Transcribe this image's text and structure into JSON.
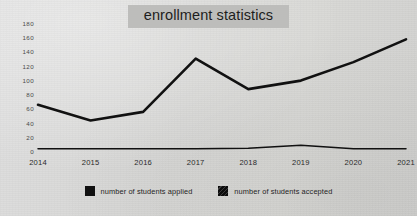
{
  "chart_data": {
    "type": "line",
    "title": "enrollment statistics",
    "xlabel": "",
    "ylabel": "",
    "categories": [
      "2014",
      "2015",
      "2016",
      "2017",
      "2018",
      "2019",
      "2020",
      "2021"
    ],
    "ylim": [
      0,
      180
    ],
    "yticks": [
      0,
      20,
      40,
      60,
      80,
      100,
      120,
      140,
      160,
      180
    ],
    "ytick_labels": [
      "0",
      "20",
      "40",
      "60",
      "80",
      "100",
      "120",
      "140",
      "160",
      "180"
    ],
    "grid": false,
    "legend_position": "bottom",
    "series": [
      {
        "name": "number of students applied",
        "swatch": "solid-dark-square",
        "color": "#111111",
        "values": [
          65,
          43,
          55,
          130,
          87,
          99,
          125,
          157
        ]
      },
      {
        "name": "number of students accepted",
        "swatch": "textured-dark-square",
        "color": "#111111",
        "values": [
          3,
          3,
          3,
          3,
          4,
          8,
          3,
          3
        ]
      }
    ]
  },
  "legend": {
    "items": [
      {
        "label": "number of students applied"
      },
      {
        "label": "number of students accepted"
      }
    ]
  }
}
